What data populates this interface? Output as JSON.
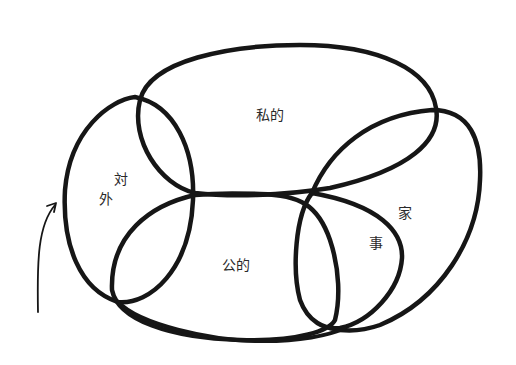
{
  "diagram": {
    "type": "hand-drawn overlapping loops (Venn-like)",
    "stroke_color": "#161616",
    "background": "#ffffff",
    "labels": {
      "private": "私的",
      "public": "公的",
      "external_1": "対",
      "external_2": "外",
      "housework_1": "家",
      "housework_2": "事"
    },
    "regions": [
      {
        "id": "private",
        "text": "私的"
      },
      {
        "id": "public",
        "text": "公的"
      },
      {
        "id": "external",
        "text": "対外"
      },
      {
        "id": "housework",
        "text": "家事"
      }
    ],
    "arrow": {
      "direction": "up-right",
      "points_to": "outer-loop-left-edge"
    }
  }
}
